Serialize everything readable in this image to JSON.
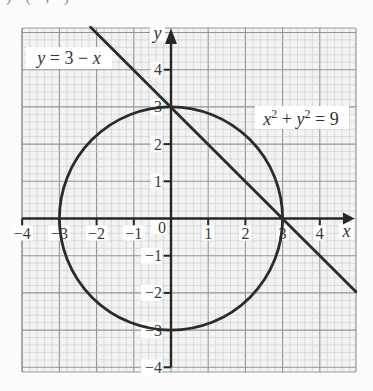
{
  "page": {
    "background": "#fcfcfc",
    "paper_fill": "#f3f4f2"
  },
  "top_fragment": {
    "text": ") ( , )"
  },
  "labels": {
    "line_eq": {
      "lhs": "y",
      "mid": " = 3 − ",
      "rhs": "x"
    },
    "circle_eq": {
      "x": "x",
      "x_exp": "2",
      "plus": " + ",
      "y": "y",
      "y_exp": "2",
      "rhs": " = 9"
    },
    "x_axis": "x",
    "y_axis": "y",
    "origin": "0"
  },
  "colors": {
    "grid_minor": "#bfc6cc",
    "grid_major": "#8e969c",
    "axis": "#262626",
    "curve": "#2b2b2b",
    "text": "#3a3a3a"
  },
  "chart_data": {
    "type": "line",
    "title": "",
    "xlabel": "x",
    "ylabel": "y",
    "xlim": [
      -4.05,
      4.97
    ],
    "ylim": [
      -4.15,
      5.14
    ],
    "grid": {
      "on": true,
      "minor_step": 0.2,
      "major_step": 1
    },
    "x_ticks": [
      {
        "v": -4,
        "label": "−4"
      },
      {
        "v": -3,
        "label": "−3"
      },
      {
        "v": -2,
        "label": "−2"
      },
      {
        "v": -1,
        "label": "−1"
      },
      {
        "v": 1,
        "label": "1"
      },
      {
        "v": 2,
        "label": "2"
      },
      {
        "v": 3,
        "label": "3"
      },
      {
        "v": 4,
        "label": "4"
      }
    ],
    "y_ticks": [
      {
        "v": 4,
        "label": "4"
      },
      {
        "v": 3,
        "label": "3"
      },
      {
        "v": 2,
        "label": "2"
      },
      {
        "v": 1,
        "label": "1"
      },
      {
        "v": -1,
        "label": "−1"
      },
      {
        "v": -2,
        "label": "−2"
      },
      {
        "v": -3,
        "label": "−3"
      },
      {
        "v": -4,
        "label": "−4"
      }
    ],
    "origin_label": "0",
    "shapes": [
      {
        "kind": "circle",
        "equation": "x² + y² = 9",
        "center": [
          0,
          0
        ],
        "radius": 3
      },
      {
        "kind": "line",
        "equation": "y = 3 − x",
        "slope": -1,
        "y_intercept": 3,
        "endpoints": [
          [
            -2.16,
            5.14
          ],
          [
            4.97,
            -1.97
          ]
        ]
      }
    ],
    "intersections": [
      [
        0,
        3
      ],
      [
        3,
        0
      ]
    ]
  }
}
